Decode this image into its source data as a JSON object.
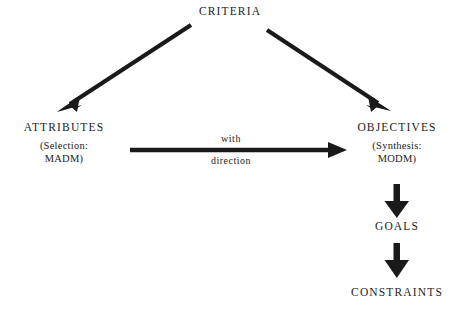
{
  "diagram": {
    "background_color": "#ffffff",
    "ink_color": "#1a1a1a",
    "nodes": {
      "criteria": {
        "title": "CRITERIA"
      },
      "attributes": {
        "title": "ATTRIBUTES",
        "sub_line1": "(Selection:",
        "sub_line2": "MADM)"
      },
      "objectives": {
        "title": "OBJECTIVES",
        "sub_line1": "(Synthesis:",
        "sub_line2": "MODM)"
      },
      "goals": {
        "title": "GOALS"
      },
      "constraints": {
        "title": "CONSTRAINTS"
      }
    },
    "edges": {
      "criteria_to_attributes": {
        "label": ""
      },
      "criteria_to_objectives": {
        "label": ""
      },
      "attributes_to_objectives": {
        "label_above": "with",
        "label_below": "direction"
      },
      "objectives_to_goals": {
        "label": ""
      },
      "goals_to_constraints": {
        "label": ""
      }
    }
  }
}
